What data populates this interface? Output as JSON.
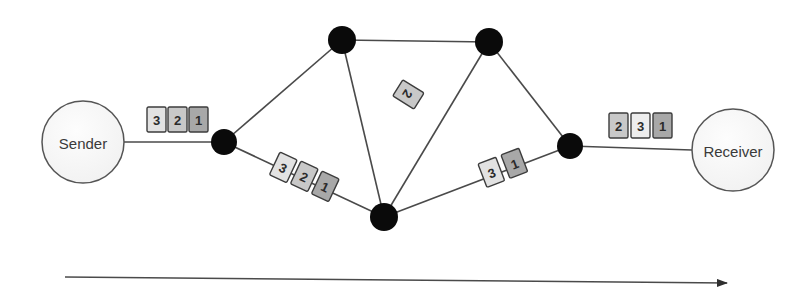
{
  "figure": {
    "background_color": "#ffffff",
    "node_color": "#0a0a0a",
    "edge_color": "#4a4a4a",
    "endpoint_fill": "#f7f7f7",
    "endpoint_stroke": "#555555",
    "packet_border_color": "#3c3c3c",
    "packet_text_color": "#2b2b2b"
  },
  "endpoints": [
    {
      "id": "sender",
      "label": "Sender",
      "cx": 83,
      "cy": 142,
      "r": 41
    },
    {
      "id": "receiver",
      "label": "Receiver",
      "cx": 733,
      "cy": 150,
      "r": 41
    }
  ],
  "routers": [
    {
      "id": "r-left",
      "cx": 224,
      "cy": 142,
      "r": 13
    },
    {
      "id": "r-top-left",
      "cx": 342,
      "cy": 40,
      "r": 14
    },
    {
      "id": "r-top-right",
      "cx": 489,
      "cy": 42,
      "r": 14
    },
    {
      "id": "r-bottom",
      "cx": 384,
      "cy": 217,
      "r": 14
    },
    {
      "id": "r-right",
      "cx": 570,
      "cy": 146,
      "r": 13
    }
  ],
  "links": [
    {
      "id": "link-sender-left",
      "from": "sender",
      "to": "r-left",
      "x1": 124,
      "y1": 142,
      "x2": 224,
      "y2": 142
    },
    {
      "id": "link-left-topleft",
      "from": "r-left",
      "to": "r-top-left",
      "x1": 224,
      "y1": 142,
      "x2": 342,
      "y2": 40
    },
    {
      "id": "link-topleft-topright",
      "from": "r-top-left",
      "to": "r-top-right",
      "x1": 342,
      "y1": 40,
      "x2": 489,
      "y2": 42
    },
    {
      "id": "link-topleft-bottom",
      "from": "r-top-left",
      "to": "r-bottom",
      "x1": 342,
      "y1": 40,
      "x2": 384,
      "y2": 217
    },
    {
      "id": "link-left-bottom",
      "from": "r-left",
      "to": "r-bottom",
      "x1": 224,
      "y1": 142,
      "x2": 384,
      "y2": 217
    },
    {
      "id": "link-bottom-topright",
      "from": "r-bottom",
      "to": "r-top-right",
      "x1": 384,
      "y1": 217,
      "x2": 489,
      "y2": 42
    },
    {
      "id": "link-topright-right",
      "from": "r-top-right",
      "to": "r-right",
      "x1": 489,
      "y1": 42,
      "x2": 570,
      "y2": 146
    },
    {
      "id": "link-bottom-right",
      "from": "r-bottom",
      "to": "r-right",
      "x1": 384,
      "y1": 217,
      "x2": 570,
      "y2": 146
    },
    {
      "id": "link-right-receiver",
      "from": "r-right",
      "to": "receiver",
      "x1": 570,
      "y1": 146,
      "x2": 692,
      "y2": 150
    }
  ],
  "packet_groups": [
    {
      "id": "packets-sender-link",
      "on_link": "link-sender-left",
      "rotation": 0,
      "packets": [
        {
          "label": "3",
          "x": 147,
          "y": 107,
          "fill": "#e2e2e2"
        },
        {
          "label": "2",
          "x": 168,
          "y": 107,
          "fill": "#c8c8c8"
        },
        {
          "label": "1",
          "x": 189,
          "y": 107,
          "fill": "#a8a8a8"
        }
      ]
    },
    {
      "id": "packets-lower-left-link",
      "on_link": "link-left-bottom",
      "rotation": 25,
      "packets": [
        {
          "label": "3",
          "x": 280,
          "y": 152,
          "fill": "#e2e2e2"
        },
        {
          "label": "2",
          "x": 301,
          "y": 161,
          "fill": "#c8c8c8"
        },
        {
          "label": "1",
          "x": 322,
          "y": 171,
          "fill": "#a8a8a8"
        }
      ]
    },
    {
      "id": "packets-diagonal-link",
      "on_link": "link-bottom-topright",
      "rotation": 122,
      "packets": [
        {
          "label": "2",
          "x": 424,
          "y": 93,
          "fill": "#c8c8c8"
        }
      ]
    },
    {
      "id": "packets-lower-right-link",
      "on_link": "link-bottom-right",
      "rotation": -21,
      "packets": [
        {
          "label": "3",
          "x": 478,
          "y": 164,
          "fill": "#e2e2e2"
        },
        {
          "label": "1",
          "x": 501,
          "y": 155,
          "fill": "#a8a8a8"
        }
      ]
    },
    {
      "id": "packets-receiver-link",
      "on_link": "link-right-receiver",
      "rotation": 0,
      "packets": [
        {
          "label": "2",
          "x": 609,
          "y": 113,
          "fill": "#c8c8c8"
        },
        {
          "label": "3",
          "x": 631,
          "y": 113,
          "fill": "#ededed"
        },
        {
          "label": "1",
          "x": 653,
          "y": 113,
          "fill": "#a8a8a8"
        }
      ]
    }
  ],
  "packet_box": {
    "width": 19,
    "height": 25
  },
  "time_axis": {
    "id": "time-arrow",
    "x1": 65,
    "y1": 277,
    "x2": 727,
    "y2": 283,
    "color": "#4a4a4a"
  }
}
